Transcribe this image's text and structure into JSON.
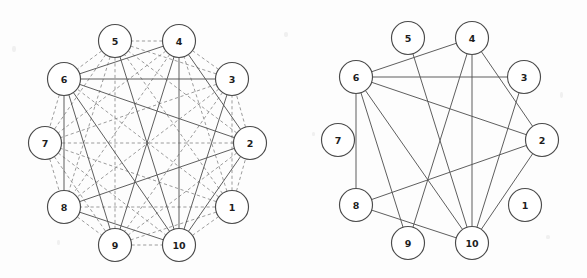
{
  "figure": {
    "title": "",
    "background_color": "#fdfdfd",
    "panels": [
      {
        "id": "left",
        "name": "complete-graph-panel",
        "caption": ""
      },
      {
        "id": "right",
        "name": "subgraph-panel",
        "caption": ""
      }
    ]
  },
  "colors": {
    "node_fill": "#ffffff",
    "node_stroke": "#4a4a4a",
    "label": "#1d1d1d",
    "solid_edge": "#555555",
    "dashed_edge": "#8a8a8a"
  },
  "chart_data": {
    "type": "diagram",
    "subtype": "node-link-graph",
    "title": "",
    "node_labels": [
      "1",
      "2",
      "3",
      "4",
      "5",
      "6",
      "7",
      "8",
      "9",
      "10"
    ],
    "layout": "circular",
    "nodes": [
      {
        "id": 1,
        "label": "1",
        "left": {
          "x": 232,
          "y": 207
        },
        "right": {
          "x": 231,
          "y": 205
        }
      },
      {
        "id": 2,
        "label": "2",
        "left": {
          "x": 250,
          "y": 143
        },
        "right": {
          "x": 248,
          "y": 140
        }
      },
      {
        "id": 3,
        "label": "3",
        "left": {
          "x": 232,
          "y": 79
        },
        "right": {
          "x": 230,
          "y": 77
        }
      },
      {
        "id": 4,
        "label": "4",
        "left": {
          "x": 179,
          "y": 41
        },
        "right": {
          "x": 178,
          "y": 38
        }
      },
      {
        "id": 5,
        "label": "5",
        "left": {
          "x": 115,
          "y": 41
        },
        "right": {
          "x": 114,
          "y": 38
        }
      },
      {
        "id": 6,
        "label": "6",
        "left": {
          "x": 64,
          "y": 79
        },
        "right": {
          "x": 62,
          "y": 77
        }
      },
      {
        "id": 7,
        "label": "7",
        "left": {
          "x": 45,
          "y": 143
        },
        "right": {
          "x": 44,
          "y": 140
        }
      },
      {
        "id": 8,
        "label": "8",
        "left": {
          "x": 64,
          "y": 207
        },
        "right": {
          "x": 62,
          "y": 205
        }
      },
      {
        "id": 9,
        "label": "9",
        "left": {
          "x": 115,
          "y": 245
        },
        "right": {
          "x": 114,
          "y": 243
        }
      },
      {
        "id": 10,
        "label": "10",
        "left": {
          "x": 179,
          "y": 245
        },
        "right": {
          "x": 178,
          "y": 243
        }
      }
    ],
    "node_radius": 16.5,
    "left_graph": {
      "name": "complete-graph-K10",
      "description": "Complete graph on 10 vertices; solid edges are the selected subgraph, dashed edges are the remaining pairs.",
      "solid_edges": [
        [
          6,
          4
        ],
        [
          6,
          3
        ],
        [
          6,
          2
        ],
        [
          6,
          8
        ],
        [
          6,
          9
        ],
        [
          6,
          10
        ],
        [
          4,
          10
        ],
        [
          4,
          9
        ],
        [
          4,
          2
        ],
        [
          3,
          10
        ],
        [
          2,
          8
        ],
        [
          2,
          10
        ],
        [
          5,
          10
        ],
        [
          8,
          10
        ]
      ],
      "dashed_edges": [
        [
          1,
          2
        ],
        [
          1,
          3
        ],
        [
          1,
          4
        ],
        [
          1,
          5
        ],
        [
          1,
          6
        ],
        [
          1,
          7
        ],
        [
          1,
          8
        ],
        [
          1,
          9
        ],
        [
          1,
          10
        ],
        [
          2,
          3
        ],
        [
          2,
          5
        ],
        [
          2,
          7
        ],
        [
          2,
          9
        ],
        [
          3,
          4
        ],
        [
          3,
          5
        ],
        [
          3,
          7
        ],
        [
          3,
          8
        ],
        [
          3,
          9
        ],
        [
          4,
          5
        ],
        [
          4,
          7
        ],
        [
          4,
          8
        ],
        [
          5,
          6
        ],
        [
          5,
          7
        ],
        [
          5,
          8
        ],
        [
          5,
          9
        ],
        [
          6,
          7
        ],
        [
          7,
          8
        ],
        [
          7,
          9
        ],
        [
          7,
          10
        ],
        [
          8,
          9
        ],
        [
          9,
          10
        ]
      ]
    },
    "right_graph": {
      "name": "selected-subgraph",
      "description": "Only the solid edges of the left panel are retained; vertices 1 and 7 are isolated.",
      "solid_edges": [
        [
          6,
          4
        ],
        [
          6,
          3
        ],
        [
          6,
          2
        ],
        [
          6,
          8
        ],
        [
          6,
          9
        ],
        [
          6,
          10
        ],
        [
          4,
          10
        ],
        [
          4,
          9
        ],
        [
          4,
          2
        ],
        [
          3,
          10
        ],
        [
          2,
          8
        ],
        [
          2,
          10
        ],
        [
          5,
          10
        ],
        [
          8,
          10
        ]
      ],
      "dashed_edges": [],
      "isolated_nodes": [
        1,
        7
      ]
    }
  }
}
